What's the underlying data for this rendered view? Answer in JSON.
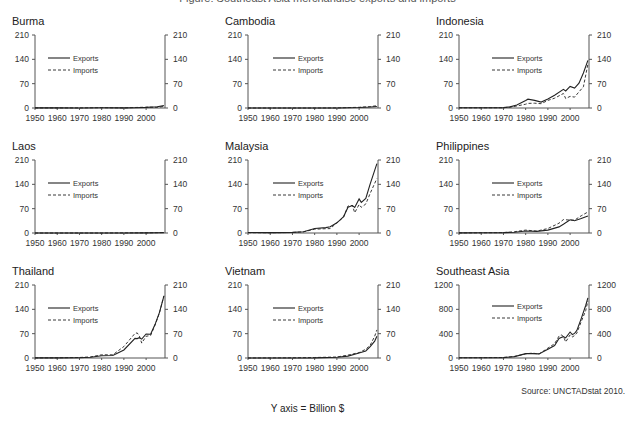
{
  "figure": {
    "title": "Figure: Southeast Asia merchandise exports and imports",
    "y_axis_note": "Y axis = Billion $",
    "source": "Source: UNCTADstat 2010.",
    "legend": {
      "exports": "Exports",
      "imports": "Imports"
    },
    "x_ticks": [
      "1950",
      "1960",
      "1970",
      "1980",
      "1990",
      "2000"
    ]
  },
  "chart_data": [
    {
      "type": "line",
      "title": "Burma",
      "xlabel": "",
      "ylabel": "Billion $",
      "ylim": [
        0,
        210
      ],
      "yticks": [
        0,
        70,
        140,
        210
      ],
      "x": [
        1950,
        1960,
        1970,
        1980,
        1990,
        1995,
        2000,
        2005,
        2008
      ],
      "series": [
        {
          "name": "Exports",
          "values": [
            0.2,
            0.2,
            0.1,
            0.5,
            0.3,
            0.9,
            1.6,
            3.6,
            6.9
          ]
        },
        {
          "name": "Imports",
          "values": [
            0.2,
            0.3,
            0.2,
            0.8,
            0.3,
            1.3,
            2.4,
            1.9,
            4.3
          ]
        }
      ]
    },
    {
      "type": "line",
      "title": "Cambodia",
      "xlabel": "",
      "ylabel": "Billion $",
      "ylim": [
        0,
        210
      ],
      "yticks": [
        0,
        70,
        140,
        210
      ],
      "x": [
        1950,
        1960,
        1970,
        1980,
        1990,
        1995,
        2000,
        2005,
        2008
      ],
      "series": [
        {
          "name": "Exports",
          "values": [
            0.05,
            0.1,
            0.05,
            0.01,
            0.1,
            0.9,
            1.4,
            3.0,
            4.4
          ]
        },
        {
          "name": "Imports",
          "values": [
            0.05,
            0.1,
            0.1,
            0.1,
            0.2,
            1.2,
            1.9,
            3.9,
            6.5
          ]
        }
      ]
    },
    {
      "type": "line",
      "title": "Indonesia",
      "xlabel": "",
      "ylabel": "Billion $",
      "ylim": [
        0,
        210
      ],
      "yticks": [
        0,
        70,
        140,
        210
      ],
      "x": [
        1950,
        1960,
        1970,
        1973,
        1976,
        1980,
        1981,
        1984,
        1987,
        1990,
        1993,
        1997,
        1998,
        2000,
        2002,
        2004,
        2006,
        2008
      ],
      "series": [
        {
          "name": "Exports",
          "values": [
            0.8,
            0.8,
            1.1,
            3.2,
            8.5,
            21.9,
            25.2,
            21.9,
            17.1,
            25.7,
            36.8,
            53.4,
            48.8,
            62.1,
            57.2,
            71.6,
            100.8,
            137.0
          ]
        },
        {
          "name": "Imports",
          "values": [
            0.5,
            0.6,
            1.0,
            2.7,
            5.7,
            10.8,
            13.3,
            13.9,
            12.4,
            21.8,
            28.3,
            41.7,
            27.3,
            33.5,
            31.3,
            46.5,
            61.1,
            126.2
          ]
        }
      ]
    },
    {
      "type": "line",
      "title": "Laos",
      "xlabel": "",
      "ylabel": "Billion $",
      "ylim": [
        0,
        210
      ],
      "yticks": [
        0,
        70,
        140,
        210
      ],
      "x": [
        1950,
        1960,
        1970,
        1980,
        1990,
        2000,
        2005,
        2008
      ],
      "series": [
        {
          "name": "Exports",
          "values": [
            0.0,
            0.0,
            0.0,
            0.03,
            0.08,
            0.33,
            0.55,
            1.1
          ]
        },
        {
          "name": "Imports",
          "values": [
            0.0,
            0.01,
            0.1,
            0.1,
            0.2,
            0.54,
            0.88,
            1.4
          ]
        }
      ]
    },
    {
      "type": "line",
      "title": "Malaysia",
      "xlabel": "",
      "ylabel": "Billion $",
      "ylim": [
        0,
        210
      ],
      "yticks": [
        0,
        70,
        140,
        210
      ],
      "x": [
        1950,
        1960,
        1970,
        1975,
        1980,
        1985,
        1987,
        1990,
        1993,
        1995,
        1997,
        1998,
        2000,
        2001,
        2003,
        2005,
        2008
      ],
      "series": [
        {
          "name": "Exports",
          "values": [
            1.3,
            1.2,
            1.7,
            3.8,
            13.0,
            15.4,
            17.9,
            29.4,
            47.1,
            73.9,
            78.7,
            73.3,
            98.2,
            88.0,
            99.4,
            141.6,
            199.5
          ]
        },
        {
          "name": "Imports",
          "values": [
            0.9,
            1.0,
            1.4,
            3.5,
            10.8,
            12.3,
            12.7,
            29.3,
            45.6,
            77.7,
            79.0,
            58.3,
            82.0,
            73.9,
            83.3,
            114.3,
            156.9
          ]
        }
      ]
    },
    {
      "type": "line",
      "title": "Philippines",
      "xlabel": "",
      "ylabel": "Billion $",
      "ylim": [
        0,
        210
      ],
      "yticks": [
        0,
        70,
        140,
        210
      ],
      "x": [
        1950,
        1960,
        1970,
        1975,
        1980,
        1985,
        1990,
        1995,
        1997,
        2000,
        2002,
        2005,
        2008
      ],
      "series": [
        {
          "name": "Exports",
          "values": [
            0.3,
            0.6,
            1.1,
            2.3,
            5.7,
            4.6,
            8.2,
            17.5,
            25.2,
            38.1,
            35.2,
            41.3,
            49.1
          ]
        },
        {
          "name": "Imports",
          "values": [
            0.4,
            0.6,
            1.2,
            3.8,
            8.3,
            5.5,
            13.0,
            28.3,
            38.6,
            37.0,
            37.2,
            49.5,
            60.4
          ]
        }
      ]
    },
    {
      "type": "line",
      "title": "Thailand",
      "xlabel": "",
      "ylabel": "Billion $",
      "ylim": [
        0,
        210
      ],
      "yticks": [
        0,
        70,
        140,
        210
      ],
      "x": [
        1950,
        1960,
        1970,
        1975,
        1980,
        1985,
        1990,
        1995,
        1996,
        1997,
        1998,
        2000,
        2002,
        2004,
        2006,
        2008
      ],
      "series": [
        {
          "name": "Exports",
          "values": [
            0.3,
            0.4,
            0.7,
            2.2,
            6.5,
            7.1,
            23.1,
            56.4,
            55.7,
            58.4,
            54.5,
            69.1,
            68.1,
            96.2,
            130.6,
            177.8
          ]
        },
        {
          "name": "Imports",
          "values": [
            0.3,
            0.5,
            1.3,
            3.3,
            9.2,
            9.2,
            33.0,
            70.8,
            72.3,
            62.9,
            42.9,
            62.4,
            64.6,
            94.4,
            128.8,
            179.2
          ]
        }
      ]
    },
    {
      "type": "line",
      "title": "Vietnam",
      "xlabel": "",
      "ylabel": "Billion $",
      "ylim": [
        0,
        210
      ],
      "yticks": [
        0,
        70,
        140,
        210
      ],
      "x": [
        1950,
        1960,
        1970,
        1980,
        1990,
        1995,
        2000,
        2003,
        2005,
        2007,
        2008
      ],
      "series": [
        {
          "name": "Exports",
          "values": [
            0.0,
            0.1,
            0.1,
            0.3,
            2.4,
            5.4,
            14.5,
            20.1,
            32.4,
            48.6,
            62.7
          ]
        },
        {
          "name": "Imports",
          "values": [
            0.0,
            0.2,
            0.5,
            1.3,
            2.8,
            8.2,
            15.6,
            25.3,
            36.8,
            62.8,
            80.7
          ]
        }
      ]
    },
    {
      "type": "line",
      "title": "Southeast Asia",
      "xlabel": "",
      "ylabel": "Billion $",
      "ylim": [
        0,
        1200
      ],
      "yticks": [
        0,
        400,
        800,
        1200
      ],
      "x": [
        1950,
        1960,
        1970,
        1975,
        1980,
        1983,
        1986,
        1990,
        1993,
        1995,
        1996,
        1997,
        1998,
        2000,
        2001,
        2002,
        2003,
        2005,
        2007,
        2008
      ],
      "series": [
        {
          "name": "Exports",
          "values": [
            4,
            5,
            7,
            23,
            72,
            73,
            68,
            143,
            205,
            320,
            339,
            350,
            330,
            427,
            387,
            404,
            451,
            647,
            863,
            990
          ]
        },
        {
          "name": "Imports",
          "values": [
            4,
            5,
            8,
            26,
            68,
            81,
            65,
            162,
            235,
            360,
            379,
            355,
            263,
            381,
            347,
            369,
            407,
            596,
            779,
            938
          ]
        }
      ]
    }
  ]
}
